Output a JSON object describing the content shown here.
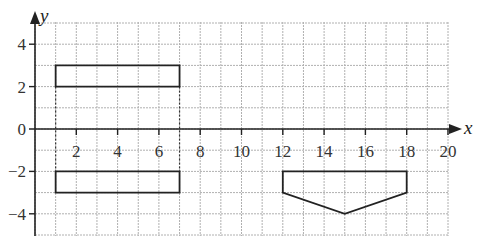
{
  "diagram": {
    "type": "coordinate-grid",
    "axes": {
      "x_label": "x",
      "y_label": "y",
      "x_range": [
        0,
        20
      ],
      "y_range": [
        -5,
        5
      ],
      "x_ticks": [
        {
          "value": 2,
          "label": "2"
        },
        {
          "value": 4,
          "label": "4"
        },
        {
          "value": 6,
          "label": "6"
        },
        {
          "value": 8,
          "label": "8"
        },
        {
          "value": 10,
          "label": "10"
        },
        {
          "value": 12,
          "label": "12"
        },
        {
          "value": 14,
          "label": "14"
        },
        {
          "value": 16,
          "label": "16"
        },
        {
          "value": 18,
          "label": "18"
        },
        {
          "value": 20,
          "label": "20"
        }
      ],
      "y_ticks": [
        {
          "value": 4,
          "label": "4"
        },
        {
          "value": 2,
          "label": "2"
        },
        {
          "value": 0,
          "label": "0"
        },
        {
          "value": -2,
          "label": "−2"
        },
        {
          "value": -4,
          "label": "−4"
        }
      ]
    },
    "shapes": [
      {
        "name": "rectangle-upper",
        "points": [
          [
            1,
            2
          ],
          [
            7,
            2
          ],
          [
            7,
            3
          ],
          [
            1,
            3
          ]
        ]
      },
      {
        "name": "rectangle-lower",
        "points": [
          [
            1,
            -3
          ],
          [
            7,
            -3
          ],
          [
            7,
            -2
          ],
          [
            1,
            -2
          ]
        ]
      },
      {
        "name": "pentagon",
        "points": [
          [
            12,
            -2
          ],
          [
            18,
            -2
          ],
          [
            18,
            -3
          ],
          [
            15,
            -4
          ],
          [
            12,
            -3
          ]
        ]
      }
    ],
    "dotted_lines": [
      {
        "x": 1,
        "y_from": 2,
        "y_to": -2
      },
      {
        "x": 7,
        "y_from": 2,
        "y_to": -2
      }
    ],
    "colors": {
      "grid": "#b0b0b0",
      "axis": "#222222",
      "shape": "#222222"
    }
  }
}
